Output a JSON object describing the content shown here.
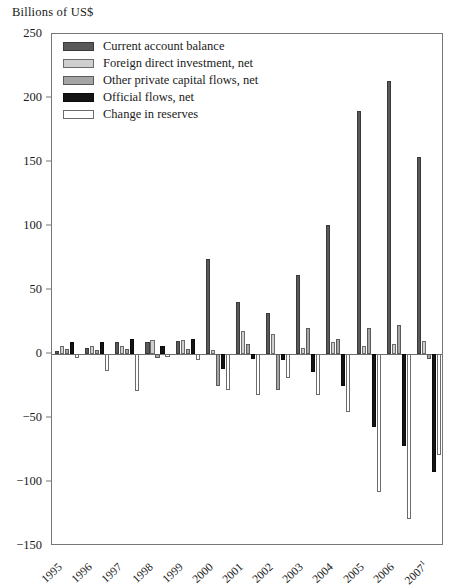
{
  "chart_data": {
    "type": "bar",
    "title": "Billions of US$",
    "xlabel": "",
    "ylabel": "Billions of US$",
    "ylim": [
      -150,
      250
    ],
    "ytick_values": [
      250,
      200,
      150,
      100,
      50,
      0,
      -50,
      -100,
      -150
    ],
    "ytick_labels": [
      "250",
      "200",
      "150",
      "100",
      "50",
      "0",
      "−50",
      "−100",
      "−150"
    ],
    "grid": false,
    "legend_position": "top-left",
    "categories": [
      "1995",
      "1996",
      "1997",
      "1998",
      "1999",
      "2000",
      "2001",
      "2002",
      "2003",
      "2004",
      "2005",
      "2006",
      "2007"
    ],
    "category_labels": [
      "1995",
      "1996",
      "1997",
      "1998",
      "1999",
      "2000",
      "2001",
      "2002",
      "2003",
      "2004",
      "2005",
      "2006",
      "2007"
    ],
    "last_category_footnote": "1",
    "series": [
      {
        "name": "Current account balance",
        "color": "#595959",
        "values": [
          2,
          5,
          9,
          9,
          10,
          74,
          41,
          32,
          62,
          101,
          190,
          213,
          154
        ]
      },
      {
        "name": "Foreign direct investment, net",
        "color": "#cfcfcf",
        "values": [
          6,
          6,
          6,
          11,
          11,
          3,
          18,
          16,
          5,
          9,
          6,
          8,
          10
        ]
      },
      {
        "name": "Other private capital flows, net",
        "color": "#a5a5a5",
        "values": [
          4,
          3,
          4,
          -3,
          4,
          -25,
          8,
          -28,
          20,
          12,
          20,
          23,
          -4
        ]
      },
      {
        "name": "Official flows, net",
        "color": "#141414",
        "values": [
          9,
          9,
          12,
          6,
          12,
          -12,
          -4,
          -5,
          -14,
          -25,
          -57,
          -72,
          -92
        ]
      },
      {
        "name": "Change in reserves",
        "color": "#ffffff",
        "values": [
          -3,
          -13,
          -29,
          -2,
          -5,
          -28,
          -32,
          -19,
          -32,
          -45,
          -108,
          -129,
          -79
        ]
      }
    ]
  },
  "legend": {
    "items": [
      {
        "label": "Current account balance",
        "swatch": "s0"
      },
      {
        "label": "Foreign direct investment, net",
        "swatch": "s1"
      },
      {
        "label": "Other private capital flows, net",
        "swatch": "s2"
      },
      {
        "label": "Official flows, net",
        "swatch": "s3"
      },
      {
        "label": "Change in reserves",
        "swatch": "s4"
      }
    ]
  }
}
